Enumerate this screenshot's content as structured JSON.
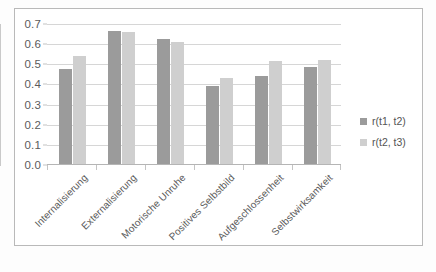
{
  "chart_data": {
    "type": "bar",
    "title": "",
    "subtitle": "",
    "xlabel": "",
    "ylabel": "",
    "ylim": [
      0.0,
      0.7
    ],
    "ytick_step": 0.1,
    "ytick_labels": [
      "0.0",
      "0.1",
      "0.2",
      "0.3",
      "0.4",
      "0.5",
      "0.6",
      "0.7"
    ],
    "ytick_values": [
      0.0,
      0.1,
      0.2,
      0.3,
      0.4,
      0.5,
      0.6,
      0.7
    ],
    "grid": true,
    "grid_axis": "y",
    "legend_position": "right",
    "categories": [
      "Internalisierung",
      "Externalisierung",
      "Motorische Unruhe",
      "Positives Selbstbild",
      "Aufgeschlossenheit",
      "Selbstwirksamkeit"
    ],
    "series": [
      {
        "name": "r(t1, t2)",
        "color": "#9b9b9b",
        "values": [
          0.475,
          0.665,
          0.625,
          0.39,
          0.44,
          0.485
        ]
      },
      {
        "name": "r(t2, t3)",
        "color": "#cfcfcf",
        "values": [
          0.54,
          0.66,
          0.61,
          0.43,
          0.515,
          0.52
        ]
      }
    ]
  },
  "legend": {
    "items": [
      {
        "label": "r(t1, t2)",
        "series": 0
      },
      {
        "label": "r(t2, t3)",
        "series": 1
      }
    ]
  }
}
